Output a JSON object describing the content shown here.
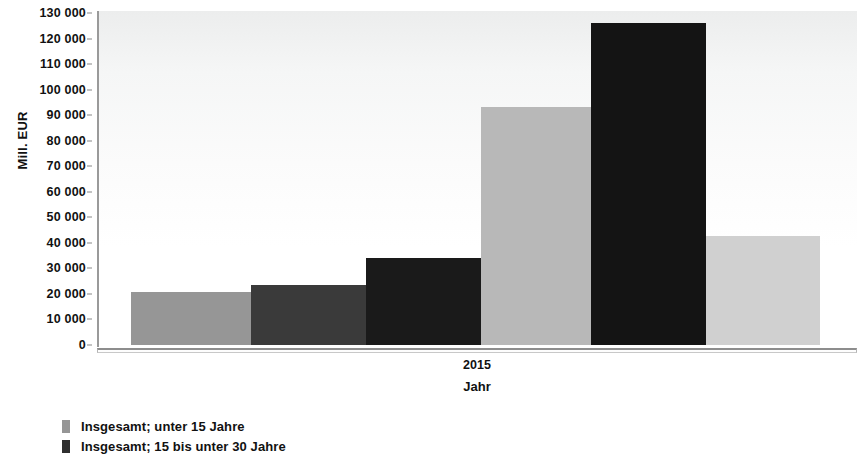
{
  "chart_data": {
    "type": "bar",
    "title": "",
    "xlabel": "Jahr",
    "ylabel": "Mill. EUR",
    "categories": [
      "2015"
    ],
    "ylim": [
      0,
      130000
    ],
    "ytick_step": 10000,
    "ytick_labels": [
      "130 000",
      "120 000",
      "110 000",
      "100 000",
      "90 000",
      "80 000",
      "70 000",
      "60 000",
      "50 000",
      "40 000",
      "30 000",
      "20 000",
      "10 000",
      "0"
    ],
    "ytick_values": [
      130000,
      120000,
      110000,
      100000,
      90000,
      80000,
      70000,
      60000,
      50000,
      40000,
      30000,
      20000,
      10000,
      0
    ],
    "grid": false,
    "legend_position": "bottom-left",
    "series": [
      {
        "name": "Insgesamt; unter 15 Jahre",
        "values": [
          20500
        ],
        "color": "#969696"
      },
      {
        "name": "Insgesamt; 15 bis unter 30 Jahre",
        "values": [
          23500
        ],
        "color": "#3a3a3a"
      },
      {
        "name": "",
        "values": [
          33700
        ],
        "color": "#1a1a1a"
      },
      {
        "name": "",
        "values": [
          92500
        ],
        "color": "#b8b8b8"
      },
      {
        "name": "",
        "values": [
          125500
        ],
        "color": "#141414"
      },
      {
        "name": "",
        "values": [
          42500
        ],
        "color": "#d0d0d0"
      }
    ]
  },
  "axes": {
    "y_title": "Mill. EUR",
    "x_title": "Jahr",
    "x_tick": "2015"
  },
  "legend": {
    "items": [
      {
        "label": "Insgesamt; unter 15 Jahre",
        "color": "#969696"
      },
      {
        "label": "Insgesamt; 15 bis unter 30 Jahre",
        "color": "#2f2f2f"
      }
    ]
  }
}
